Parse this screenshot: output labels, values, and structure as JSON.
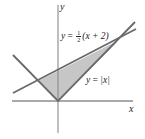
{
  "figure": {
    "axes": {
      "x_label": "x",
      "y_label": "y"
    },
    "curves": [
      {
        "name": "absolute-value",
        "label": "y = |x|",
        "label_prefix": "y",
        "label_equals": " = ",
        "label_body": "|x|"
      },
      {
        "name": "line",
        "label": "y = 1/2 (x + 2)",
        "label_prefix": "y",
        "label_equals": " = ",
        "frac_num": "1",
        "frac_den": "2",
        "label_body": "(x + 2)"
      }
    ],
    "shaded_region": {
      "description": "Region between y = 1/2(x+2) and y = |x|",
      "vertices": [
        [
          -0.6667,
          0.6667
        ],
        [
          0,
          0
        ],
        [
          2,
          2
        ]
      ],
      "fill_color": "#c8c8c8"
    },
    "colors": {
      "axis": "#7a7a7a",
      "curve": "#6e6e6e",
      "shade": "#c8c8c8",
      "text": "#222222"
    }
  }
}
